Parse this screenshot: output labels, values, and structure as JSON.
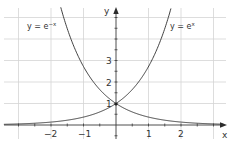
{
  "chart_data": {
    "type": "line",
    "title": "",
    "xlabel": "x",
    "ylabel": "y",
    "xlim": [
      -3.5,
      3.4
    ],
    "ylim": [
      -0.5,
      5.5
    ],
    "grid": true,
    "x_ticks": [
      -2,
      -1,
      1,
      2
    ],
    "x_tick_labels": [
      "−2",
      "−1",
      "1",
      "2"
    ],
    "y_ticks": [
      1,
      2,
      3
    ],
    "y_tick_labels": [
      "1",
      "2",
      "3"
    ],
    "series": [
      {
        "name": "y = e^x",
        "label_base": "y = e",
        "label_sup": "x",
        "function": "exp(x)",
        "x": [
          -3,
          -2,
          -1,
          0,
          1,
          1.5,
          1.66
        ],
        "values": [
          0.05,
          0.14,
          0.37,
          1,
          2.72,
          4.48,
          5.26
        ]
      },
      {
        "name": "y = e^-x",
        "label_base": "y = e",
        "label_sup": "−x",
        "function": "exp(-x)",
        "x": [
          -1.66,
          -1.5,
          -1,
          0,
          1,
          2,
          3
        ],
        "values": [
          5.26,
          4.48,
          2.72,
          1,
          0.37,
          0.14,
          0.05
        ]
      }
    ],
    "annotations": [
      {
        "text": "y = e^-x",
        "position": "upper-left"
      },
      {
        "text": "y = e^x",
        "position": "upper-right"
      },
      {
        "text": "intersection (0, 1)",
        "marker": "dot"
      }
    ]
  }
}
